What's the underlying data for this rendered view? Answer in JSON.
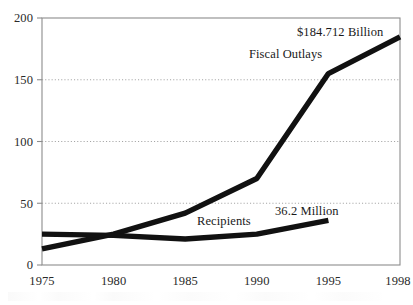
{
  "chart_data": {
    "type": "line",
    "title": "",
    "subtitle": "",
    "xlabel": "",
    "ylabel": "",
    "x": [
      1975,
      1980,
      1985,
      1990,
      1995,
      1998
    ],
    "x_tick_labels": [
      "1975",
      "1980",
      "1985",
      "1990",
      "1995",
      "1998"
    ],
    "y_tick_labels": [
      "0",
      "50",
      "100",
      "150",
      "200"
    ],
    "y_ticks": [
      0,
      50,
      100,
      150,
      200
    ],
    "ylim": [
      0,
      200
    ],
    "xlim": [
      1975,
      1998
    ],
    "grid": "horizontal-dotted",
    "legend_position": "inline-annotations",
    "series": [
      {
        "name": "Fiscal Outlays",
        "x": [
          1975,
          1980,
          1985,
          1990,
          1995,
          1998
        ],
        "values": [
          13,
          25,
          42,
          70,
          155,
          184.712
        ],
        "color": "#111111",
        "end_label": "$184.712 Billion",
        "units": "Billions of dollars"
      },
      {
        "name": "Recipients",
        "x": [
          1975,
          1980,
          1985,
          1990,
          1995
        ],
        "values": [
          25,
          24,
          21,
          25,
          36.2
        ],
        "color": "#111111",
        "end_label": "36.2 Million",
        "units": "Millions of people"
      }
    ],
    "annotations": [
      {
        "text": "$184.712 Billion",
        "x": 1995.0,
        "y": 190
      },
      {
        "text": "Fiscal Outlays",
        "x": 1990.2,
        "y": 171
      },
      {
        "text": "Recipients",
        "x": 1985.4,
        "y": 33
      },
      {
        "text": "36.2 Million",
        "x": 1991.6,
        "y": 41
      }
    ]
  },
  "axes": {
    "y_labels": [
      "200",
      "150",
      "100",
      "50",
      "0"
    ],
    "x_labels": [
      "1975",
      "1980",
      "1985",
      "1990",
      "1995",
      "1998"
    ]
  },
  "annotations": {
    "outlays_value": "$184.712 Billion",
    "outlays_name": "Fiscal Outlays",
    "recipients_name": "Recipients",
    "recipients_value": "36.2 Million"
  },
  "colors": {
    "series_line": "#111111",
    "frame": "#8c8c8c",
    "gridline": "#9a9a9a",
    "text": "#1a1a1a",
    "background": "#ffffff"
  }
}
